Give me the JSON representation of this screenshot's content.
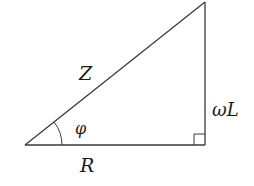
{
  "diagram": {
    "colors": {
      "line": "#3a3a3a",
      "text": "#1a1a1a",
      "background": "#ffffff"
    },
    "vertices": {
      "origin": {
        "x": 25,
        "y": 145
      },
      "right_angle": {
        "x": 205,
        "y": 145
      },
      "top": {
        "x": 205,
        "y": 2
      }
    },
    "labels": {
      "hypotenuse": "Z",
      "vertical_side": "ωL",
      "base": "R",
      "angle": "φ"
    },
    "right_angle_marker_size": 11,
    "angle_arc_radius": 37
  }
}
